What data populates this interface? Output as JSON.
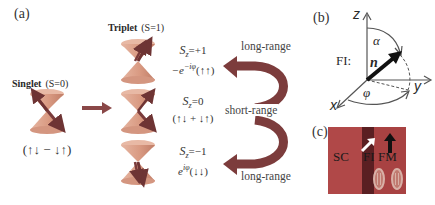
{
  "panels": {
    "a": {
      "label": "(a)",
      "singlet": {
        "title_bold": "Singlet",
        "title_spin": "(S=0)",
        "state": "(↑↓ − ↓↑)"
      },
      "triplet": {
        "title_bold": "Triplet",
        "title_spin": "(S=1)",
        "states": [
          {
            "sz_label": "S",
            "sz_sub": "z",
            "sz_value": "=+1",
            "wavefunction": "−e^{−iφ}(↑↑)",
            "wf_prefix": "−e",
            "wf_exp": "−iφ",
            "wf_spin": "(↑↑)"
          },
          {
            "sz_label": "S",
            "sz_sub": "z",
            "sz_value": "=0",
            "wavefunction": "(↑↓ + ↓↑)"
          },
          {
            "sz_label": "S",
            "sz_sub": "z",
            "sz_value": "=−1",
            "wavefunction": "e^{iφ}(↓↓)",
            "wf_prefix": "e",
            "wf_exp": "iφ",
            "wf_spin": "(↓↓)"
          }
        ]
      },
      "ranges": {
        "top": "long-range",
        "middle": "short-range",
        "bottom": "long-range"
      }
    },
    "b": {
      "label": "(b)",
      "axis_z": "z",
      "axis_x": "x",
      "axis_y": "y",
      "layer": "FI:",
      "vector": "n",
      "angle_polar": "α",
      "angle_azimuth": "φ"
    },
    "c": {
      "label": "(c)",
      "layers": [
        "SC",
        "FI",
        "FM"
      ],
      "colors": {
        "sc": "#b04848",
        "fi": "#5a1f22",
        "fm": "#a84040",
        "arrow_fi": "#ffffff",
        "arrow_fm": "#111111",
        "electron_ring": "#c9a8a0"
      }
    }
  },
  "colors": {
    "cone": "#d9a08a",
    "cone_dark": "#c6826c",
    "arrow_spin": "#7a3b3b",
    "range_arrow": "#7c3c3c",
    "panel_arrow": "#8a4848"
  }
}
